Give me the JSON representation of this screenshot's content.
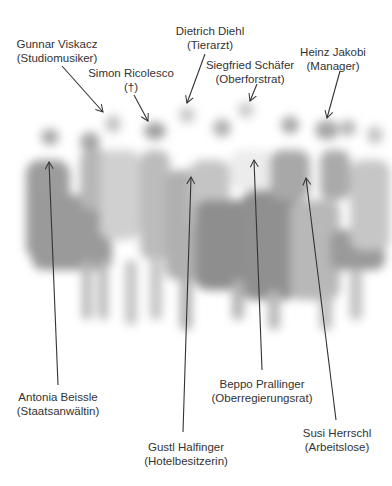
{
  "figure": {
    "type": "annotated-group-photo",
    "photo_description": "blurred grayscale group photo of people standing",
    "labels": [
      {
        "name": "Gunnar Viskacz",
        "role": "(Studiomusiker)",
        "x": 57,
        "y": 37,
        "arrow": [
          62,
          66,
          103,
          112
        ]
      },
      {
        "name": "Dietrich Diehl",
        "role": "(Tierarzt)",
        "x": 210,
        "y": 24,
        "arrow": [
          205,
          54,
          187,
          103
        ]
      },
      {
        "name": "Simon Ricolesco",
        "role": "(†)",
        "x": 131,
        "y": 66,
        "arrow": [
          134,
          95,
          148,
          121
        ]
      },
      {
        "name": "Siegfried Schäfer",
        "role": "(Oberforstrat)",
        "x": 250,
        "y": 58,
        "arrow": [
          257,
          84,
          250,
          101
        ]
      },
      {
        "name": "Heinz Jakobi",
        "role": "(Manager)",
        "x": 333,
        "y": 45,
        "arrow": [
          340,
          71,
          327,
          118
        ]
      },
      {
        "name": "Antonia Beissle",
        "role": "(Staatsanwältin)",
        "x": 58,
        "y": 390,
        "arrow": [
          58,
          385,
          49,
          162
        ]
      },
      {
        "name": "Gustl Halfinger",
        "role": "(Hotelbesitzerin)",
        "x": 186,
        "y": 440,
        "arrow": [
          183,
          432,
          191,
          177
        ]
      },
      {
        "name": "Beppo Prallinger",
        "role": "(Oberregierungsrat)",
        "x": 262,
        "y": 377,
        "arrow": [
          262,
          370,
          254,
          160
        ]
      },
      {
        "name": "Susi Herrschl",
        "role": "(Arbeitslose)",
        "x": 337,
        "y": 426,
        "arrow": [
          336,
          420,
          306,
          178
        ]
      }
    ],
    "colors": {
      "text": "#333333",
      "arrow": "#333333",
      "figures": "#9a9a9a",
      "background": "#ffffff"
    }
  }
}
